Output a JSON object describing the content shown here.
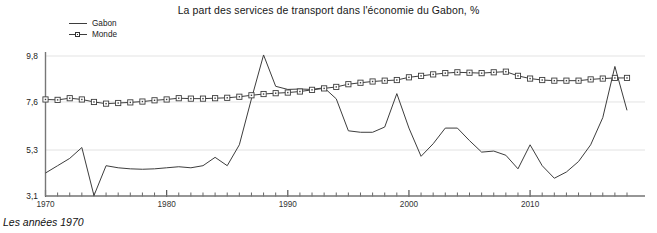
{
  "chart_data": {
    "type": "line",
    "title": "La part des services de transport dans l'économie du Gabon, %",
    "caption": "Les années 1970",
    "xlabel": "",
    "ylabel": "",
    "xlim": [
      1970,
      2018
    ],
    "ylim": [
      3.1,
      9.8
    ],
    "grid": true,
    "legend_position": "top-left",
    "y_ticks": [
      "9,8",
      "7,6",
      "5,3",
      "3,1"
    ],
    "y_tick_values": [
      9.8,
      7.6,
      5.3,
      3.1
    ],
    "x_ticks": [
      "1970",
      "1980",
      "1990",
      "2000",
      "2010"
    ],
    "x_tick_values": [
      1970,
      1980,
      1990,
      2000,
      2010
    ],
    "x": [
      1970,
      1971,
      1972,
      1973,
      1974,
      1975,
      1976,
      1977,
      1978,
      1979,
      1980,
      1981,
      1982,
      1983,
      1984,
      1985,
      1986,
      1987,
      1988,
      1989,
      1990,
      1991,
      1992,
      1993,
      1994,
      1995,
      1996,
      1997,
      1998,
      1999,
      2000,
      2001,
      2002,
      2003,
      2004,
      2005,
      2006,
      2007,
      2008,
      2009,
      2010,
      2011,
      2012,
      2013,
      2014,
      2015,
      2016,
      2017,
      2018
    ],
    "series": [
      {
        "name": "Gabon",
        "color": "#3d3d3d",
        "marker": "none",
        "values": [
          4.2,
          4.55,
          4.9,
          5.42,
          3.12,
          4.55,
          4.45,
          4.4,
          4.38,
          4.4,
          4.45,
          4.5,
          4.45,
          4.55,
          4.95,
          4.55,
          5.55,
          7.75,
          9.85,
          8.35,
          8.2,
          8.22,
          8.2,
          8.28,
          7.75,
          6.22,
          6.15,
          6.15,
          6.4,
          8.0,
          6.35,
          5.0,
          5.6,
          6.35,
          6.35,
          5.75,
          5.2,
          5.25,
          5.05,
          4.4,
          5.55,
          4.55,
          3.95,
          4.25,
          4.75,
          5.55,
          6.85,
          9.3,
          7.2
        ]
      },
      {
        "name": "Monde",
        "color": "#3d3d3d",
        "marker": "square",
        "values": [
          7.72,
          7.7,
          7.78,
          7.72,
          7.6,
          7.52,
          7.55,
          7.58,
          7.62,
          7.68,
          7.72,
          7.78,
          7.76,
          7.76,
          7.78,
          7.8,
          7.85,
          7.92,
          7.98,
          8.02,
          8.05,
          8.1,
          8.18,
          8.25,
          8.32,
          8.45,
          8.52,
          8.58,
          8.62,
          8.65,
          8.78,
          8.85,
          8.92,
          8.98,
          9.02,
          9.0,
          8.98,
          9.02,
          9.05,
          8.85,
          8.72,
          8.65,
          8.62,
          8.62,
          8.62,
          8.68,
          8.72,
          8.75,
          8.75
        ]
      }
    ],
    "legend": [
      {
        "label": "Gabon",
        "marker": "none"
      },
      {
        "label": "Monde",
        "marker": "square"
      }
    ],
    "colors": {
      "line": "#3d3d3d",
      "grid": "#e3e3e3",
      "axis": "#777777",
      "text": "#1a1a1a",
      "background": "#ffffff"
    }
  }
}
